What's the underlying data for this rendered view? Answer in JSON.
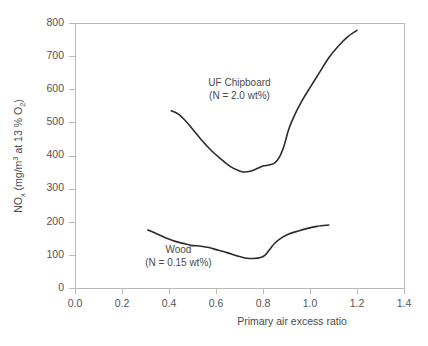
{
  "chart_data": {
    "type": "line",
    "title": "",
    "xlabel": "Primary air excess ratio",
    "ylabel": "NOx (mg/m3 at 13 % O2)",
    "ylabel_parts": {
      "lead": "NO",
      "lead_sub": "x",
      "mid": " (mg/m",
      "mid_sup": "3",
      "tail": " at 13 % O",
      "tail_sub": "2",
      "close": ")"
    },
    "xlim": [
      0.0,
      1.4
    ],
    "ylim": [
      0,
      800
    ],
    "xticks": [
      0.0,
      0.2,
      0.4,
      0.6,
      0.8,
      1.0,
      1.2,
      1.4
    ],
    "xtick_labels": [
      "0.0",
      "0.2",
      "0.4",
      "0.6",
      "0.8",
      "1.0",
      "1.2",
      "1.4"
    ],
    "yticks": [
      0,
      100,
      200,
      300,
      400,
      500,
      600,
      700,
      800
    ],
    "ytick_labels": [
      "0",
      "100",
      "200",
      "300",
      "400",
      "500",
      "600",
      "700",
      "800"
    ],
    "grid": false,
    "legend": "none",
    "series": [
      {
        "name": "UF Chipboard",
        "annotation_line1": "UF Chipboard",
        "annotation_line2": "(N = 2.0 wt%)",
        "nitrogen_content": "2.0 wt%",
        "color": "#2b2b2b",
        "x": [
          0.41,
          0.44,
          0.47,
          0.5,
          0.54,
          0.58,
          0.62,
          0.66,
          0.7,
          0.72,
          0.75,
          0.78,
          0.8,
          0.83,
          0.85,
          0.87,
          0.89,
          0.91,
          0.94,
          0.97,
          1.0,
          1.04,
          1.08,
          1.12,
          1.16,
          1.2
        ],
        "y": [
          535,
          525,
          505,
          480,
          445,
          415,
          390,
          367,
          353,
          350,
          353,
          362,
          368,
          372,
          378,
          395,
          430,
          480,
          530,
          570,
          605,
          650,
          695,
          730,
          758,
          778
        ]
      },
      {
        "name": "Wood",
        "annotation_line1": "Wood",
        "annotation_line2": "(N = 0.15 wt%)",
        "nitrogen_content": "0.15 wt%",
        "color": "#2b2b2b",
        "x": [
          0.31,
          0.35,
          0.39,
          0.43,
          0.47,
          0.5,
          0.53,
          0.57,
          0.61,
          0.65,
          0.69,
          0.73,
          0.76,
          0.79,
          0.81,
          0.83,
          0.85,
          0.88,
          0.91,
          0.95,
          0.99,
          1.03,
          1.08
        ],
        "y": [
          175,
          163,
          150,
          140,
          133,
          128,
          127,
          122,
          114,
          106,
          97,
          90,
          89,
          92,
          100,
          118,
          135,
          152,
          163,
          172,
          180,
          186,
          190
        ]
      }
    ],
    "annotations": [
      {
        "id": "uf-chipboard-label",
        "line1": "UF Chipboard",
        "line2": "(N = 2.0 wt%)",
        "x": 0.7,
        "y": 610
      },
      {
        "id": "wood-label",
        "line1": "Wood",
        "line2": "(N = 0.15 wt%)",
        "x": 0.44,
        "y": 105
      }
    ]
  }
}
